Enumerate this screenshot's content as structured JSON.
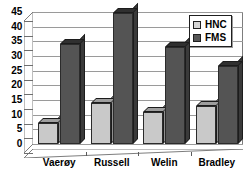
{
  "chart_data": {
    "type": "bar",
    "title": "",
    "xlabel": "",
    "ylabel": "",
    "categories": [
      "Vaerøy",
      "Russell",
      "Welin",
      "Bradley"
    ],
    "series": [
      {
        "name": "HNC",
        "color": "#c9c9c9",
        "values": [
          7,
          14,
          11,
          13
        ]
      },
      {
        "name": "FMS",
        "color": "#545454",
        "values": [
          34,
          44.5,
          33,
          26.5
        ]
      }
    ],
    "ylim": [
      0,
      45
    ],
    "yticks": [
      0,
      5,
      10,
      15,
      20,
      25,
      30,
      35,
      40,
      45
    ],
    "ytick_labels": [
      "0",
      "5",
      "10",
      "15",
      "20",
      "25",
      "30",
      "35",
      "40",
      "45"
    ],
    "grid": true,
    "legend_position": "top-right",
    "style": "3d-column"
  },
  "legend": {
    "items": [
      {
        "label": "HNC",
        "swatch": "light-gray-swatch"
      },
      {
        "label": "FMS",
        "swatch": "dark-gray-swatch"
      }
    ]
  }
}
